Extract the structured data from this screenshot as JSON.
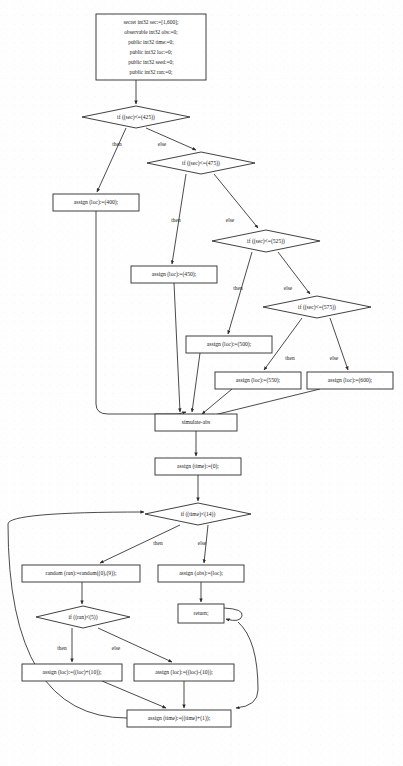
{
  "diagram": {
    "kind": "flowchart",
    "style": {
      "background": "#fefefe",
      "node_fill": "#ffffff",
      "node_stroke": "#2b2b2b",
      "text_color": "#1a1a1a"
    },
    "nodes": [
      {
        "id": "decl",
        "type": "box",
        "x": 96,
        "y": 14,
        "w": 110,
        "h": 66,
        "lines": [
          "secret int32 sec:=[1,600];",
          "observable int32 obs:=0;",
          "public int32 time:=0;",
          "public int32 loc:=0;",
          "public int32 seed:=0;",
          "public int32 ran:=0;"
        ]
      },
      {
        "id": "if425",
        "type": "diamond",
        "x": 82,
        "y": 106,
        "w": 108,
        "h": 22,
        "label": "if ((sec)<=(425))"
      },
      {
        "id": "if475",
        "type": "diamond",
        "x": 147,
        "y": 152,
        "w": 108,
        "h": 22,
        "label": "if ((sec)<=(475))"
      },
      {
        "id": "loc400",
        "type": "box",
        "x": 53,
        "y": 194,
        "w": 86,
        "h": 17,
        "label": "assign (loc):=(400);"
      },
      {
        "id": "if525",
        "type": "diamond",
        "x": 212,
        "y": 230,
        "w": 108,
        "h": 22,
        "label": "if ((sec)<=(525))"
      },
      {
        "id": "loc450",
        "type": "box",
        "x": 131,
        "y": 266,
        "w": 86,
        "h": 17,
        "label": "assign (loc):=(450);"
      },
      {
        "id": "if575",
        "type": "diamond",
        "x": 263,
        "y": 296,
        "w": 108,
        "h": 22,
        "label": "if ((sec)<=(575))"
      },
      {
        "id": "loc500",
        "type": "box",
        "x": 186,
        "y": 336,
        "w": 86,
        "h": 17,
        "label": "assign (loc):=(500);"
      },
      {
        "id": "loc550",
        "type": "box",
        "x": 215,
        "y": 372,
        "w": 86,
        "h": 17,
        "label": "assign (loc):=(550);"
      },
      {
        "id": "loc600",
        "type": "box",
        "x": 307,
        "y": 372,
        "w": 86,
        "h": 17,
        "label": "assign (loc):=(600);"
      },
      {
        "id": "simabs",
        "type": "box",
        "x": 155,
        "y": 414,
        "w": 82,
        "h": 17,
        "label": "simulate-abs"
      },
      {
        "id": "time0",
        "type": "box",
        "x": 155,
        "y": 458,
        "w": 86,
        "h": 17,
        "label": "assign (time):=(0);"
      },
      {
        "id": "iftime",
        "type": "diamond",
        "x": 145,
        "y": 503,
        "w": 106,
        "h": 22,
        "label": "if ((time)<(14))"
      },
      {
        "id": "random",
        "type": "box",
        "x": 22,
        "y": 565,
        "w": 118,
        "h": 17,
        "label": "random (ran):=random((0),(9));"
      },
      {
        "id": "obsloc",
        "type": "box",
        "x": 158,
        "y": 565,
        "w": 86,
        "h": 17,
        "label": "assign (obs):=(loc);"
      },
      {
        "id": "ifran",
        "type": "diamond",
        "x": 36,
        "y": 606,
        "w": 94,
        "h": 22,
        "label": "if ((ran)<(5))"
      },
      {
        "id": "return",
        "type": "box",
        "x": 178,
        "y": 604,
        "w": 46,
        "h": 19,
        "label": "return;"
      },
      {
        "id": "locplus",
        "type": "box",
        "x": 22,
        "y": 664,
        "w": 100,
        "h": 17,
        "label": "assign (loc):=((loc)+(10));"
      },
      {
        "id": "locminus",
        "type": "box",
        "x": 134,
        "y": 664,
        "w": 100,
        "h": 17,
        "label": "assign (loc):=((loc)-(10));"
      },
      {
        "id": "timeplus",
        "type": "box",
        "x": 127,
        "y": 710,
        "w": 104,
        "h": 17,
        "label": "assign (time):=((time)+(1));"
      }
    ],
    "edge_labels": [
      {
        "id": "l1",
        "text": "then",
        "x": 117,
        "y": 146
      },
      {
        "id": "l2",
        "text": "else",
        "x": 162,
        "y": 146
      },
      {
        "id": "l3",
        "text": "then",
        "x": 176,
        "y": 222
      },
      {
        "id": "l4",
        "text": "else",
        "x": 230,
        "y": 222
      },
      {
        "id": "l5",
        "text": "then",
        "x": 238,
        "y": 290
      },
      {
        "id": "l6",
        "text": "else",
        "x": 288,
        "y": 290
      },
      {
        "id": "l7",
        "text": "then",
        "x": 290,
        "y": 360
      },
      {
        "id": "l8",
        "text": "else",
        "x": 334,
        "y": 360
      },
      {
        "id": "l9",
        "text": "then",
        "x": 158,
        "y": 545
      },
      {
        "id": "l10",
        "text": "else",
        "x": 202,
        "y": 545
      },
      {
        "id": "l11",
        "text": "then",
        "x": 62,
        "y": 650
      },
      {
        "id": "l12",
        "text": "else",
        "x": 116,
        "y": 650
      }
    ],
    "edges": [
      {
        "id": "e1",
        "from": "decl",
        "to": "if425",
        "path": "M136,80 L136,104"
      },
      {
        "id": "e2",
        "from": "if425",
        "to": "loc400",
        "path": "M126,128 L97,192"
      },
      {
        "id": "e3",
        "from": "if425",
        "to": "if475",
        "path": "M146,128 L196,150"
      },
      {
        "id": "e4",
        "from": "if475",
        "to": "loc450",
        "path": "M186,174 L172,264"
      },
      {
        "id": "e5",
        "from": "if475",
        "to": "if525",
        "path": "M214,174 L258,228"
      },
      {
        "id": "e6",
        "from": "if525",
        "to": "loc500",
        "path": "M252,252 L228,334"
      },
      {
        "id": "e7",
        "from": "if525",
        "to": "if575",
        "path": "M278,252 L310,294"
      },
      {
        "id": "e8",
        "from": "if575",
        "to": "loc550",
        "path": "M302,318 L264,370"
      },
      {
        "id": "e9",
        "from": "if575",
        "to": "loc600",
        "path": "M330,318 L348,370"
      },
      {
        "id": "e10",
        "from": "loc400",
        "to": "simabs",
        "path": "M96,211 L96,404 Q96,414 108,414 L178,414 L186,412"
      },
      {
        "id": "e11",
        "from": "loc450",
        "to": "simabs",
        "path": "M174,283 L180,412"
      },
      {
        "id": "e12",
        "from": "loc500",
        "to": "simabs",
        "path": "M200,353 L192,412"
      },
      {
        "id": "e13",
        "from": "loc550",
        "to": "simabs",
        "path": "M232,389 L202,414"
      },
      {
        "id": "e14",
        "from": "loc600",
        "to": "simabs",
        "path": "M320,389 L210,416"
      },
      {
        "id": "e15",
        "from": "simabs",
        "to": "time0",
        "path": "M196,431 L196,456"
      },
      {
        "id": "e16",
        "from": "time0",
        "to": "iftime",
        "path": "M198,475 L198,501"
      },
      {
        "id": "e17",
        "from": "iftime",
        "to": "random",
        "path": "M180,525 L100,563"
      },
      {
        "id": "e18",
        "from": "iftime",
        "to": "obsloc",
        "path": "M208,525 L204,563"
      },
      {
        "id": "e19",
        "from": "random",
        "to": "ifran",
        "path": "M82,582 L82,604"
      },
      {
        "id": "e20",
        "from": "obsloc",
        "to": "return",
        "path": "M201,582 L201,602"
      },
      {
        "id": "e21",
        "from": "return",
        "to": "return",
        "path": "M224,608 Q244,609 242,616 Q240,623 226,619"
      },
      {
        "id": "e22",
        "from": "ifran",
        "to": "locplus",
        "path": "M72,628 L72,662"
      },
      {
        "id": "e23",
        "from": "ifran",
        "to": "locminus",
        "path": "M98,628 L172,662"
      },
      {
        "id": "e24",
        "from": "locplus",
        "to": "timeplus",
        "path": "M102,681 L166,708"
      },
      {
        "id": "e25",
        "from": "locminus",
        "to": "timeplus",
        "path": "M184,681 L184,708"
      },
      {
        "id": "e26",
        "from": "return",
        "to": "timeplus",
        "path": "M238,622 Q258,640 258,690 Q258,706 236,708"
      },
      {
        "id": "e27",
        "from": "timeplus",
        "to": "iftime",
        "path": "M127,718 Q8,718 8,524 Q8,512 144,512"
      }
    ]
  }
}
